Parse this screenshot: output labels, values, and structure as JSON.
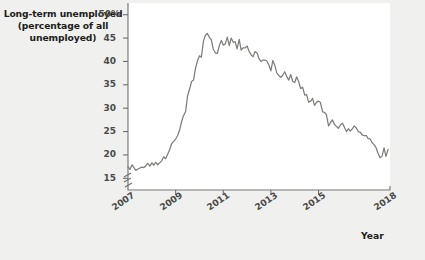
{
  "chart_data": {
    "type": "line",
    "title": "Long-term unemployed (percentage of all unemployed)",
    "title_lines": [
      "Long-term unemployed",
      "(percentage of all",
      "unemployed)"
    ],
    "xlabel": "Year",
    "ylabel": "",
    "grid": false,
    "legend": null,
    "axis_break": true,
    "ylim": [
      12.5,
      52.5
    ],
    "xlim": [
      2007.0,
      2018.0
    ],
    "yticks": [
      15,
      20,
      25,
      30,
      35,
      40,
      45,
      50
    ],
    "ytick_labels": [
      "15",
      "20",
      "25",
      "30",
      "35",
      "40",
      "45",
      "50%"
    ],
    "xticks": [
      2007,
      2009,
      2011,
      2013,
      2015,
      2018
    ],
    "xtick_labels": [
      "2007",
      "2009",
      "2011",
      "2013",
      "2015",
      "2018"
    ],
    "series": [
      {
        "name": "Long-term unemployed (percentage of all unemployed)",
        "color": "#7d7d7b",
        "x": [
          2007.0,
          2007.08,
          2007.17,
          2007.25,
          2007.33,
          2007.42,
          2007.5,
          2007.58,
          2007.67,
          2007.75,
          2007.83,
          2007.92,
          2008.0,
          2008.08,
          2008.17,
          2008.25,
          2008.33,
          2008.42,
          2008.5,
          2008.58,
          2008.67,
          2008.75,
          2008.83,
          2008.92,
          2009.0,
          2009.08,
          2009.17,
          2009.25,
          2009.33,
          2009.42,
          2009.5,
          2009.58,
          2009.67,
          2009.75,
          2009.83,
          2009.92,
          2010.0,
          2010.08,
          2010.17,
          2010.25,
          2010.33,
          2010.42,
          2010.5,
          2010.58,
          2010.67,
          2010.75,
          2010.83,
          2010.92,
          2011.0,
          2011.08,
          2011.17,
          2011.25,
          2011.33,
          2011.42,
          2011.5,
          2011.58,
          2011.67,
          2011.75,
          2011.83,
          2011.92,
          2012.0,
          2012.08,
          2012.17,
          2012.25,
          2012.33,
          2012.42,
          2012.5,
          2012.58,
          2012.67,
          2012.75,
          2012.83,
          2012.92,
          2013.0,
          2013.08,
          2013.17,
          2013.25,
          2013.33,
          2013.42,
          2013.5,
          2013.58,
          2013.67,
          2013.75,
          2013.83,
          2013.92,
          2014.0,
          2014.08,
          2014.17,
          2014.25,
          2014.33,
          2014.42,
          2014.5,
          2014.58,
          2014.67,
          2014.75,
          2014.83,
          2014.92,
          2015.0,
          2015.08,
          2015.17,
          2015.25,
          2015.33,
          2015.42,
          2015.5,
          2015.58,
          2015.67,
          2015.75,
          2015.83,
          2015.92,
          2016.0,
          2016.08,
          2016.17,
          2016.25,
          2016.33,
          2016.42,
          2016.5,
          2016.58,
          2016.67,
          2016.75,
          2016.83,
          2016.92,
          2017.0,
          2017.08,
          2017.17,
          2017.25,
          2017.33,
          2017.42,
          2017.5,
          2017.58,
          2017.67,
          2017.75,
          2017.83,
          2017.92
        ],
        "values": [
          17.5,
          16.9,
          17.9,
          17.3,
          16.7,
          17.0,
          17.2,
          17.4,
          17.3,
          17.7,
          18.2,
          17.6,
          18.3,
          17.8,
          18.4,
          17.9,
          18.3,
          18.8,
          19.6,
          19.2,
          20.2,
          21.1,
          22.4,
          22.9,
          23.4,
          24.1,
          25.4,
          27.1,
          28.4,
          29.3,
          32.6,
          34.0,
          35.7,
          36.0,
          38.4,
          40.2,
          41.2,
          40.9,
          44.4,
          45.6,
          46.0,
          45.1,
          44.6,
          42.6,
          41.8,
          41.7,
          43.3,
          44.5,
          43.5,
          43.7,
          45.2,
          43.4,
          45.0,
          44.1,
          44.2,
          42.7,
          44.7,
          42.4,
          42.9,
          42.9,
          43.3,
          42.2,
          41.4,
          41.0,
          42.1,
          41.8,
          40.6,
          40.0,
          40.3,
          40.3,
          40.1,
          39.2,
          38.0,
          40.2,
          39.1,
          37.5,
          37.0,
          36.6,
          37.1,
          37.8,
          36.7,
          36.0,
          37.2,
          35.7,
          35.5,
          36.7,
          35.6,
          34.2,
          34.5,
          32.8,
          32.9,
          31.3,
          31.5,
          32.1,
          30.6,
          31.3,
          31.5,
          31.2,
          29.2,
          29.1,
          28.6,
          26.2,
          26.9,
          27.5,
          26.5,
          26.1,
          25.7,
          26.4,
          26.8,
          26.0,
          25.0,
          25.6,
          25.1,
          25.6,
          26.2,
          25.8,
          25.0,
          24.9,
          24.3,
          24.1,
          24.2,
          23.5,
          23.4,
          22.6,
          22.2,
          21.5,
          20.3,
          19.4,
          19.8,
          21.5,
          19.7,
          21.2
        ]
      }
    ]
  }
}
